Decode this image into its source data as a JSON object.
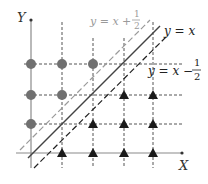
{
  "axes": {
    "x_label": "X",
    "y_label": "Y",
    "axis_color": "#8a8a8a"
  },
  "lines": [
    {
      "id": "upper",
      "label_main": "y = x +",
      "label_num": "1",
      "label_den": "2",
      "color": "#9a9a9a",
      "style": "dashed"
    },
    {
      "id": "diag",
      "label_main": "y = x",
      "color": "#444444",
      "style": "solid"
    },
    {
      "id": "lower",
      "label_main": "y = x −",
      "label_num": "1",
      "label_den": "2",
      "color": "#222222",
      "style": "dashed"
    }
  ],
  "markers": {
    "circle_color": "#707070",
    "triangle_color": "#1a1a1a",
    "circles": [
      {
        "col": 0,
        "row": 3
      },
      {
        "col": 1,
        "row": 3
      },
      {
        "col": 2,
        "row": 3
      },
      {
        "col": 0,
        "row": 2
      },
      {
        "col": 1,
        "row": 2
      },
      {
        "col": 0,
        "row": 1
      }
    ],
    "triangles": [
      {
        "col": 3,
        "row": 2
      },
      {
        "col": 4,
        "row": 2
      },
      {
        "col": 2,
        "row": 1
      },
      {
        "col": 3,
        "row": 1
      },
      {
        "col": 4,
        "row": 1
      },
      {
        "col": 1,
        "row": 0
      },
      {
        "col": 2,
        "row": 0
      },
      {
        "col": 3,
        "row": 0
      },
      {
        "col": 4,
        "row": 0
      }
    ]
  }
}
